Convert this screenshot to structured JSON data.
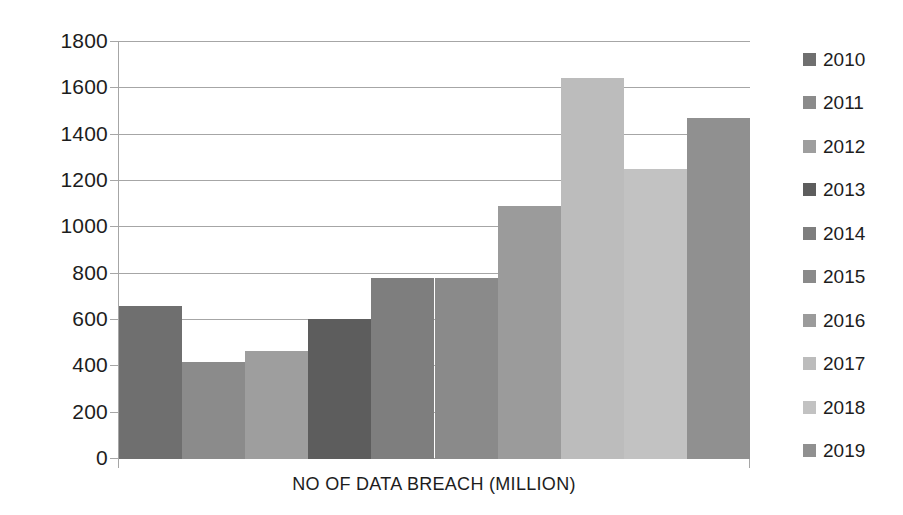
{
  "chart_data": {
    "type": "bar",
    "title": "",
    "subtitle": "",
    "xlabel": "NO OF DATA BREACH (MILLION)",
    "ylabel": "",
    "categories": [
      "2010",
      "2011",
      "2012",
      "2013",
      "2014",
      "2015",
      "2016",
      "2017",
      "2018",
      "2019"
    ],
    "values": [
      660,
      419,
      466,
      604,
      781,
      781,
      1092,
      1644,
      1252,
      1472
    ],
    "series": [
      {
        "name": "NO OF DATA BREACH (MILLION)",
        "values": [
          660,
          419,
          466,
          604,
          781,
          781,
          1092,
          1644,
          1252,
          1472
        ]
      }
    ],
    "bar_colors": [
      "#6f6f6f",
      "#8b8b8b",
      "#9e9e9e",
      "#5d5d5d",
      "#7e7e7e",
      "#8a8a8a",
      "#9b9b9b",
      "#bcbcbc",
      "#c2c2c2",
      "#909090"
    ],
    "ylim": [
      0,
      1800
    ],
    "ytick_step": 200,
    "yticks": [
      "1800",
      "1600",
      "1400",
      "1200",
      "1000",
      "800",
      "600",
      "400",
      "200",
      "0"
    ],
    "ytick_values": [
      1800,
      1600,
      1400,
      1200,
      1000,
      800,
      600,
      400,
      200,
      0
    ],
    "grid": true,
    "grid_axis": "y",
    "legend_position": "right",
    "legend": [
      {
        "label": "2010",
        "color": "#6f6f6f"
      },
      {
        "label": "2011",
        "color": "#8b8b8b"
      },
      {
        "label": "2012",
        "color": "#9e9e9e"
      },
      {
        "label": "2013",
        "color": "#5d5d5d"
      },
      {
        "label": "2014",
        "color": "#7e7e7e"
      },
      {
        "label": "2015",
        "color": "#8a8a8a"
      },
      {
        "label": "2016",
        "color": "#9b9b9b"
      },
      {
        "label": "2017",
        "color": "#bcbcbc"
      },
      {
        "label": "2018",
        "color": "#c2c2c2"
      },
      {
        "label": "2019",
        "color": "#909090"
      }
    ],
    "axis_color": "#a6a6a6",
    "text_color": "#1d1d1d",
    "background": "#ffffff"
  }
}
